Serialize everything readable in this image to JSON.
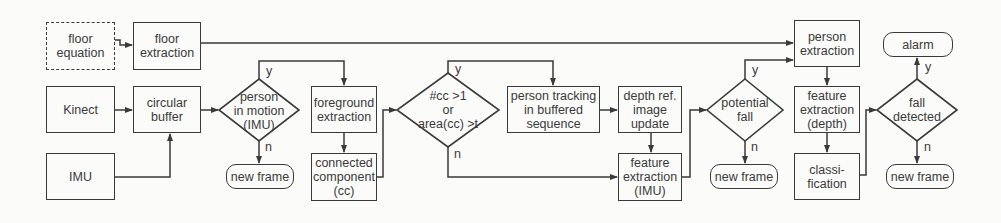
{
  "diagram": {
    "type": "flowchart",
    "colors": {
      "stroke": "#3a3a3a",
      "background": "#fbfbf9",
      "text": "#3a3a3a"
    },
    "nodes": {
      "floor_equation": {
        "label": "floor\nequation",
        "shape": "dashed-rectangle"
      },
      "floor_extraction": {
        "label": "floor\nextraction",
        "shape": "rectangle"
      },
      "kinect": {
        "label": "Kinect",
        "shape": "rectangle"
      },
      "circular_buffer": {
        "label": "circular\nbuffer",
        "shape": "rectangle"
      },
      "imu": {
        "label": "IMU",
        "shape": "rectangle"
      },
      "person_in_motion": {
        "label": "person\nin motion\n(IMU)",
        "shape": "diamond"
      },
      "new_frame_1": {
        "label": "new frame",
        "shape": "rounded-rectangle"
      },
      "foreground_extraction": {
        "label": "foreground\nextraction",
        "shape": "rectangle"
      },
      "connected_component": {
        "label": "connected\ncomponent\n(cc)",
        "shape": "rectangle"
      },
      "cc_condition": {
        "label": "#cc >1\nor\narea(cc) >t",
        "shape": "diamond"
      },
      "person_tracking": {
        "label": "person tracking\nin buffered\nsequence",
        "shape": "rectangle"
      },
      "depth_ref_update": {
        "label": "depth ref.\nimage\nupdate",
        "shape": "rectangle"
      },
      "feature_extraction_imu": {
        "label": "feature\nextraction\n(IMU)",
        "shape": "rectangle"
      },
      "potential_fall": {
        "label": "potential\nfall",
        "shape": "diamond"
      },
      "new_frame_2": {
        "label": "new frame",
        "shape": "rounded-rectangle"
      },
      "person_extraction": {
        "label": "person\nextraction",
        "shape": "rectangle"
      },
      "feature_extraction_depth": {
        "label": "feature\nextraction\n(depth)",
        "shape": "rectangle"
      },
      "classification": {
        "label": "classi-\nfication",
        "shape": "rectangle"
      },
      "fall_detected": {
        "label": "fall\ndetected",
        "shape": "diamond"
      },
      "alarm": {
        "label": "alarm",
        "shape": "rounded-rectangle"
      },
      "new_frame_3": {
        "label": "new frame",
        "shape": "rounded-rectangle"
      }
    },
    "branch_labels": {
      "yes": "y",
      "no": "n"
    },
    "edges": [
      {
        "from": "floor_equation",
        "to": "floor_extraction"
      },
      {
        "from": "floor_extraction",
        "to": "person_extraction"
      },
      {
        "from": "kinect",
        "to": "circular_buffer"
      },
      {
        "from": "imu",
        "to": "circular_buffer"
      },
      {
        "from": "circular_buffer",
        "to": "person_in_motion"
      },
      {
        "from": "person_in_motion",
        "to": "foreground_extraction",
        "label": "y"
      },
      {
        "from": "person_in_motion",
        "to": "new_frame_1",
        "label": "n"
      },
      {
        "from": "foreground_extraction",
        "to": "connected_component"
      },
      {
        "from": "connected_component",
        "to": "cc_condition"
      },
      {
        "from": "cc_condition",
        "to": "person_tracking",
        "label": "y"
      },
      {
        "from": "cc_condition",
        "to": "feature_extraction_imu",
        "label": "n"
      },
      {
        "from": "person_tracking",
        "to": "depth_ref_update"
      },
      {
        "from": "depth_ref_update",
        "to": "feature_extraction_imu"
      },
      {
        "from": "feature_extraction_imu",
        "to": "potential_fall"
      },
      {
        "from": "potential_fall",
        "to": "person_extraction",
        "label": "y"
      },
      {
        "from": "potential_fall",
        "to": "new_frame_2",
        "label": "n"
      },
      {
        "from": "person_extraction",
        "to": "feature_extraction_depth"
      },
      {
        "from": "feature_extraction_depth",
        "to": "classification"
      },
      {
        "from": "classification",
        "to": "fall_detected"
      },
      {
        "from": "fall_detected",
        "to": "alarm",
        "label": "y"
      },
      {
        "from": "fall_detected",
        "to": "new_frame_3",
        "label": "n"
      }
    ]
  }
}
